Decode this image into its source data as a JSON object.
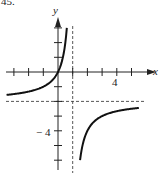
{
  "problem_number": "45.",
  "chart_data": {
    "type": "line",
    "title": "",
    "xlabel": "x",
    "ylabel": "y",
    "function": "f(x) = -2x/(x-1)",
    "xlim": [
      -3.5,
      5.5
    ],
    "ylim": [
      -6,
      4
    ],
    "grid": false,
    "x_tick_labels": [
      {
        "value": 4,
        "label": "4"
      }
    ],
    "y_tick_labels": [
      {
        "value": -4,
        "label": "− 4"
      }
    ],
    "x_ticks": [
      -3,
      -2,
      -1,
      1,
      2,
      3,
      4,
      5
    ],
    "y_ticks": [
      3,
      2,
      1,
      -1,
      -2,
      -3,
      -4,
      -5,
      -6
    ],
    "asymptotes": {
      "vertical": 1,
      "horizontal": -2
    },
    "series": [
      {
        "name": "left branch",
        "x": [
          -3.5,
          -3,
          -2,
          -1,
          -0.5,
          0,
          0.3,
          0.5,
          0.6
        ],
        "y": [
          -1.56,
          -1.5,
          -1.33,
          -1,
          -0.67,
          0,
          0.86,
          2,
          3
        ]
      },
      {
        "name": "right branch",
        "x": [
          1.5,
          1.7,
          2,
          2.5,
          3,
          4,
          5,
          5.5
        ],
        "y": [
          -6,
          -4.86,
          -4,
          -3.33,
          -3,
          -2.67,
          -2.5,
          -2.44
        ]
      }
    ]
  },
  "labels": {
    "x_axis": "x",
    "y_axis": "y",
    "tick_x_4": "4",
    "tick_y_neg4": "− 4"
  }
}
